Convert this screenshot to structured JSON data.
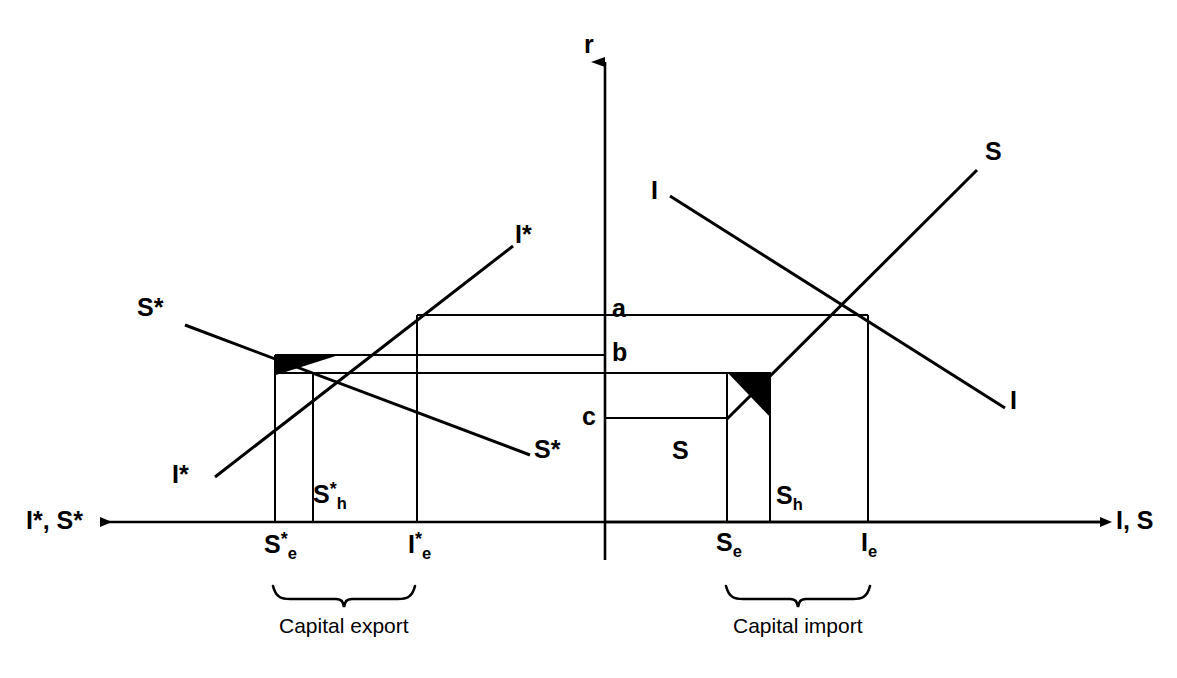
{
  "figure": {
    "type": "economic-diagram",
    "background_color": "#ffffff",
    "line_color": "#000000"
  },
  "axes": {
    "vertical": {
      "label": "r",
      "x": 605,
      "top_y": 50,
      "bottom_y": 560
    },
    "horizontal_left": {
      "label": "I*, S*",
      "arrow_tip_x": 92,
      "y": 522
    },
    "horizontal_right": {
      "label": "I, S",
      "arrow_tip_x": 1108,
      "y": 522
    }
  },
  "interest_levels": [
    {
      "name": "a",
      "label": "a",
      "y": 315
    },
    {
      "name": "b",
      "label": "b",
      "y": 371
    },
    {
      "name": "c",
      "label": "c",
      "y": 418
    }
  ],
  "curves": [
    {
      "name": "foreign-saving",
      "label_left": "S*",
      "label_right": "S*",
      "slope": "downward",
      "x1": 185,
      "y1": 325,
      "x2": 530,
      "y2": 455
    },
    {
      "name": "foreign-investment",
      "label_left": "I*",
      "label_right": "I*",
      "slope": "upward",
      "x1": 215,
      "y1": 477,
      "x2": 513,
      "y2": 246
    },
    {
      "name": "home-investment",
      "label_left": "I",
      "label_right": "I",
      "slope": "downward",
      "x1": 670,
      "y1": 196,
      "x2": 1005,
      "y2": 408
    },
    {
      "name": "home-saving",
      "label": "S",
      "label_corner": "S",
      "slope": "upward",
      "x1": 727,
      "y1": 418,
      "x2": 977,
      "y2": 170
    }
  ],
  "tick_labels": {
    "foreign_saving_equilibrium": {
      "base": "S",
      "sup": "*",
      "sub": "e",
      "x": 275
    },
    "foreign_saving_home": {
      "base": "S",
      "sup": "*",
      "sub": "h",
      "x": 313
    },
    "foreign_investment_equilibrium": {
      "base": "I",
      "sup": "*",
      "sub": "e",
      "x": 417
    },
    "home_saving_equilibrium": {
      "base": "S",
      "sub": "e",
      "x": 727
    },
    "home_saving_home": {
      "base": "S",
      "sub": "h",
      "x": 770
    },
    "home_investment_equilibrium": {
      "base": "I",
      "sub": "e",
      "x": 868
    }
  },
  "braces": [
    {
      "name": "capital-export",
      "label": "Capital export",
      "x_start": 273,
      "x_end": 415,
      "text_x": 344,
      "text_y": 625
    },
    {
      "name": "capital-import",
      "label": "Capital import",
      "x_start": 725,
      "x_end": 870,
      "text_x": 798,
      "text_y": 625
    }
  ],
  "shaded_triangles": [
    {
      "name": "foreign-welfare-triangle",
      "fill": "#000000",
      "points": "275,355 340,355 275,375"
    },
    {
      "name": "home-welfare-triangle",
      "fill": "#000000",
      "points": "727,373 770,373 727,418"
    }
  ]
}
